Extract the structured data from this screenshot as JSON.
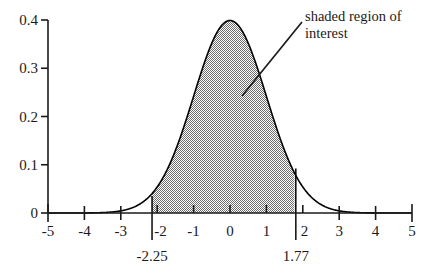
{
  "chart_data": {
    "type": "line",
    "title": "",
    "subtitle": "",
    "xlabel": "",
    "ylabel": "",
    "xlim": [
      -5,
      5
    ],
    "ylim": [
      0,
      0.4
    ],
    "grid": false,
    "legend": "none",
    "curve": {
      "name": "standard normal density",
      "distribution": "normal",
      "mean": 0,
      "sd": 1,
      "peak_value": 0.3989,
      "formula": "f(x) = (1/sqrt(2*pi)) * exp(-x^2/2)"
    },
    "shaded_region": {
      "label": "shaded region of interest",
      "lower_bound": -2.25,
      "upper_bound": 1.77,
      "fill": "#808080",
      "fill_style": "50% checkerboard dither",
      "density_at_lower": 0.0317,
      "density_at_upper": 0.0833
    },
    "x_ticks": [
      -5,
      -4,
      -3,
      -2,
      -1,
      0,
      1,
      2,
      3,
      4,
      5
    ],
    "x_tick_labels": [
      "-5",
      "-4",
      "-3",
      "-2",
      "-1",
      "0",
      "1",
      "2",
      "3",
      "4",
      "5"
    ],
    "y_ticks": [
      0,
      0.1,
      0.2,
      0.3,
      0.4
    ],
    "y_tick_labels": [
      "0",
      "0.1",
      "0.2",
      "0.3",
      "0.4"
    ],
    "boundary_markers": [
      {
        "value": -2.25,
        "label": "-2.25"
      },
      {
        "value": 1.77,
        "label": "1.77"
      }
    ],
    "annotation": {
      "line1": "shaded region of",
      "line2": "interest",
      "arrow_from_x": 302,
      "arrow_from_y": 22,
      "arrow_to_x": 242,
      "arrow_to_y": 96
    },
    "colors": {
      "axis": "#1a1a1a",
      "curve": "#000000",
      "shading": "#808080",
      "text": "#1a1a1a",
      "background": "#ffffff"
    }
  },
  "axes": {
    "y_labels": [
      "0.4",
      "0.3",
      "0.2",
      "0.1",
      "0"
    ],
    "x_labels": [
      "-5",
      "-4",
      "-3",
      "-2",
      "-1",
      "0",
      "1",
      "2",
      "3",
      "4",
      "5"
    ]
  },
  "boundaries": {
    "left_label": "-2.25",
    "right_label": "1.77"
  },
  "annotation": {
    "line1": "shaded region of",
    "line2": "interest"
  }
}
